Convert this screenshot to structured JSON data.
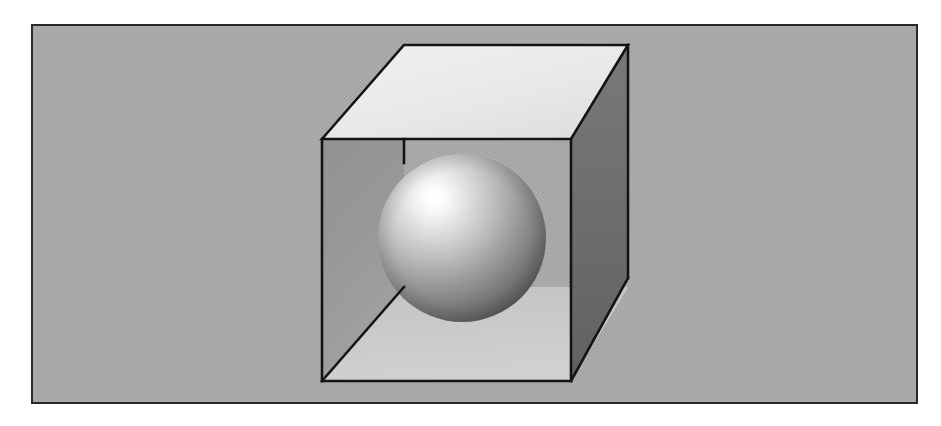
{
  "scene": {
    "title": "Sphere inside an open box",
    "canvas": {
      "width": 941,
      "height": 426
    },
    "page_background": "#ffffff",
    "frame": {
      "name": "image-frame",
      "x": 31,
      "y": 24,
      "width": 887,
      "height": 380,
      "fill": "#a8a8a8",
      "stroke": "#2a2a2a",
      "stroke_width": 2
    },
    "background_plane": {
      "name": "background-plane",
      "fill": "#a8a8a8",
      "texture": "dithered-halftone"
    },
    "line_color": "#141414",
    "line_width": 2.6,
    "box": {
      "name": "open-box",
      "description": "Cube shown as an open box: top face lid, dark right exterior wall, interior left wall and interior floor visible",
      "vertices": {
        "back_top_left": [
          404,
          45
        ],
        "back_top_right": [
          628,
          45
        ],
        "front_top_left": [
          322,
          139
        ],
        "front_top_right": [
          571,
          139
        ],
        "front_bottom_left": [
          322,
          381
        ],
        "front_bottom_right": [
          571,
          381
        ],
        "back_bottom_right": [
          628,
          278
        ],
        "back_bottom_left": [
          404,
          287
        ]
      },
      "faces": [
        {
          "name": "top-face",
          "fill": "#ebebeb",
          "shading": "brightest"
        },
        {
          "name": "right-exterior-face",
          "fill": "#6e6e6e",
          "shading": "darkest"
        },
        {
          "name": "left-interior-face",
          "fill": "#949494",
          "shading": "mid"
        },
        {
          "name": "bottom-interior-face",
          "fill": "#c9c9c9",
          "shading": "light"
        }
      ]
    },
    "sphere": {
      "name": "sphere",
      "center": [
        462,
        238
      ],
      "radius": 84,
      "highlight": {
        "cx": 435,
        "cy": 200,
        "r": 6
      },
      "gradient_stops": [
        {
          "offset": "0%",
          "color": "#ffffff"
        },
        {
          "offset": "12%",
          "color": "#f2f2f2"
        },
        {
          "offset": "28%",
          "color": "#d5d5d5"
        },
        {
          "offset": "46%",
          "color": "#b4b4b4"
        },
        {
          "offset": "64%",
          "color": "#8e8e8e"
        },
        {
          "offset": "80%",
          "color": "#6a6a6a"
        },
        {
          "offset": "92%",
          "color": "#4e4e4e"
        },
        {
          "offset": "100%",
          "color": "#3c3c3c"
        }
      ]
    }
  }
}
